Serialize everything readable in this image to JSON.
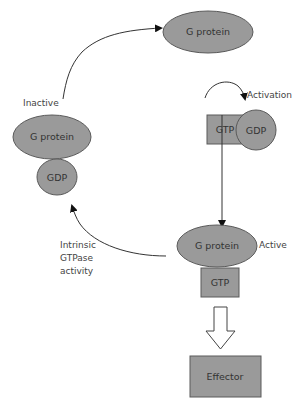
{
  "diagram": {
    "type": "G protein activation cycle",
    "nodes": {
      "top_gprotein": "G protein",
      "free_gtp": "GTP",
      "released_gdp": "GDP",
      "inactive_gprotein": "G protein",
      "inactive_gdp": "GDP",
      "active_gprotein": "G protein",
      "active_gtp": "GTP",
      "effector": "Effector"
    },
    "labels": {
      "activation": "Activation",
      "inactive": "Inactive",
      "active": "Active",
      "gtpase_line1": "Intrinsic",
      "gtpase_line2": "GTPase",
      "gtpase_line3": "activity"
    },
    "colors": {
      "shape_fill": "#9a9a9a",
      "shape_stroke": "#5a5a5a",
      "line": "#333333",
      "background": "#ffffff"
    }
  }
}
